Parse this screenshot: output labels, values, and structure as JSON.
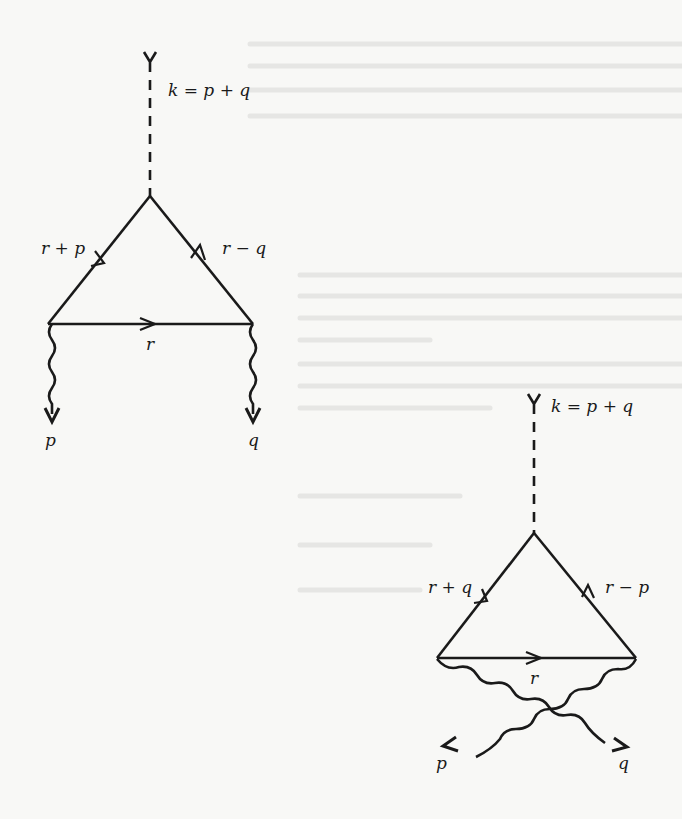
{
  "diagrams": [
    {
      "id": "direct",
      "external_line": {
        "label": "k = p + q"
      },
      "internal_lines": {
        "left": "r + p",
        "right": "r − q",
        "bottom": "r"
      },
      "outgoing": {
        "left": "p",
        "right": "q"
      }
    },
    {
      "id": "crossed",
      "external_line": {
        "label": "k = p + q"
      },
      "internal_lines": {
        "left": "r + q",
        "right": "r − p",
        "bottom": "r"
      },
      "outgoing": {
        "left": "p",
        "right": "q"
      }
    }
  ],
  "colors": {
    "ink": "#1a1a1a",
    "paper": "#f8f8f6",
    "bleed_through": "#e6e6e4"
  }
}
